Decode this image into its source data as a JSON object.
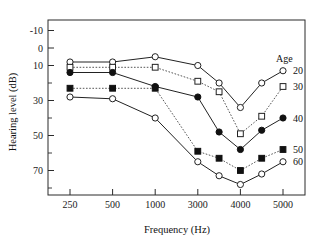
{
  "chart_data": {
    "type": "line",
    "title": "",
    "xlabel": "Frequency (Hz)",
    "ylabel": "Hearing level (dB)",
    "x": [
      250,
      500,
      1000,
      3000,
      3500,
      4000,
      4500,
      5000
    ],
    "x_tick_labels": [
      "250",
      "500",
      "1000",
      "3000",
      "4000",
      "5000"
    ],
    "x_tick_values": [
      250,
      500,
      1000,
      3000,
      4000,
      5000
    ],
    "y_tick_labels": [
      "-10",
      "0",
      "10",
      "30",
      "50",
      "70"
    ],
    "y_tick_values": [
      -10,
      0,
      10,
      30,
      50,
      70
    ],
    "y_minor_ticks": [
      20,
      40,
      60,
      80
    ],
    "ylim": [
      -16,
      84
    ],
    "y_axis_inverted": true,
    "grid": false,
    "legend_position": "right",
    "legend_title": "Age",
    "series": [
      {
        "name": "20",
        "marker": "open-circle",
        "linestyle": "solid",
        "values": [
          8,
          8,
          5,
          10,
          20,
          34,
          20,
          13
        ]
      },
      {
        "name": "30",
        "marker": "open-square",
        "linestyle": "dotted",
        "values": [
          11,
          11,
          11,
          19,
          25,
          49,
          39,
          22
        ]
      },
      {
        "name": "40",
        "marker": "filled-circle",
        "linestyle": "solid",
        "values": [
          14,
          14,
          22,
          28,
          48,
          58,
          47,
          40
        ]
      },
      {
        "name": "50",
        "marker": "filled-square",
        "linestyle": "dotted",
        "values": [
          23,
          23,
          23,
          59,
          63,
          70,
          63,
          58
        ]
      },
      {
        "name": "60",
        "marker": "open-circle",
        "linestyle": "solid",
        "values": [
          28,
          29,
          40,
          65,
          73,
          78,
          72,
          65
        ]
      }
    ],
    "legend_entries": [
      {
        "label": "20",
        "marker": "open-circle"
      },
      {
        "label": "30",
        "marker": "open-square"
      },
      {
        "label": "40",
        "marker": "filled-circle"
      },
      {
        "label": "50",
        "marker": "filled-square"
      },
      {
        "label": "60",
        "marker": "open-circle"
      }
    ],
    "colors": {
      "line": "#222222",
      "dotted_line": "#555555",
      "frame": "#2b2b2b",
      "text": "#111111",
      "background": "#ffffff"
    }
  }
}
